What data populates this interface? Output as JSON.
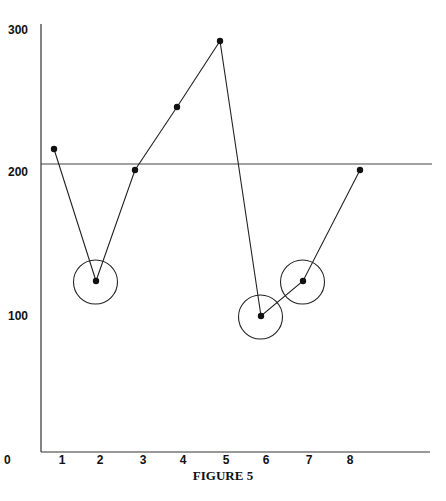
{
  "figure": {
    "caption": "FIGURE 5"
  },
  "chart_data": {
    "type": "line",
    "title": "",
    "caption": "FIGURE 5",
    "xlabel": "",
    "ylabel": "",
    "x": [
      1,
      2,
      3,
      4,
      5,
      6,
      7,
      8
    ],
    "values": [
      216,
      124,
      201,
      245,
      291,
      100,
      124,
      201
    ],
    "circled_points": [
      2,
      6,
      7
    ],
    "reference_line": {
      "y": 205,
      "label": ""
    },
    "xticks": [
      "0",
      "1",
      "2",
      "3",
      "4",
      "5",
      "6",
      "7",
      "8"
    ],
    "yticks": [
      "0",
      "100",
      "200",
      "300"
    ],
    "ylim": [
      0,
      300
    ],
    "xlim": [
      0,
      9
    ],
    "grid": false,
    "legend": null
  },
  "colors": {
    "line": "#222222",
    "marker": "#111111",
    "axis": "#333333",
    "background": "#ffffff"
  }
}
